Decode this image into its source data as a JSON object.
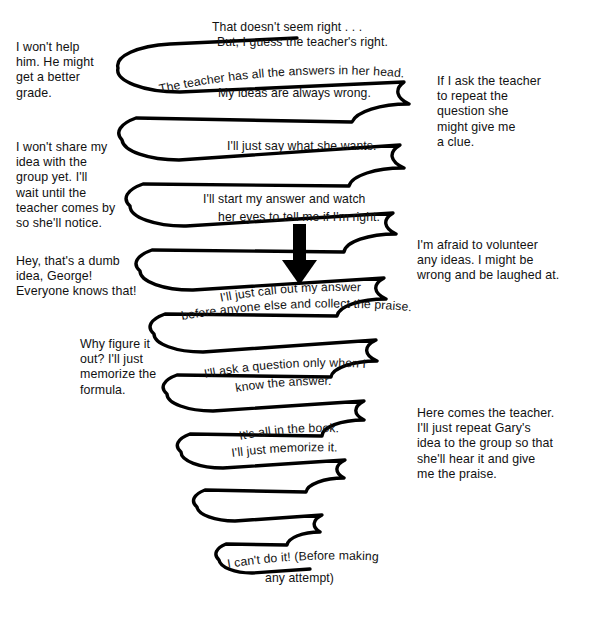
{
  "diagram": {
    "shape": "conical-spiral",
    "stroke_color": "#000000",
    "background_color": "#ffffff",
    "arrow": {
      "name": "downward-arrow",
      "direction": "down",
      "color": "#000000"
    }
  },
  "left_notes": [
    {
      "id": "note-1",
      "text": "I won't help\nhim. He might\nget a better\ngrade."
    },
    {
      "id": "note-2",
      "text": "I won't share my\nidea with the\ngroup yet. I'll\nwait until the\nteacher comes by\nso she'll notice."
    },
    {
      "id": "note-3",
      "text": "Hey, that's a dumb\nidea, George!\nEveryone knows that!"
    },
    {
      "id": "note-4",
      "text": "Why figure it\nout? I'll just\nmemorize the\nformula."
    }
  ],
  "right_notes": [
    {
      "id": "note-5",
      "text": "If I ask the teacher\nto repeat the\nquestion she\nmight give me\na clue."
    },
    {
      "id": "note-6",
      "text": "I'm afraid to volunteer\nany ideas. I might be\nwrong and be laughed at."
    },
    {
      "id": "note-7",
      "text": "Here comes the teacher.\nI'll just repeat Gary's\nidea to the group so that\nshe'll hear it and give\nme the praise."
    }
  ],
  "spiral_labels": [
    {
      "id": "label-1",
      "line1": "That doesn't seem right . . .",
      "line2": "But, I guess the teacher's right."
    },
    {
      "id": "label-2",
      "line1": "The teacher has all  the answers in her head."
    },
    {
      "id": "label-3",
      "line1": "My ideas are always wrong."
    },
    {
      "id": "label-4",
      "line1": "I'll just say what she wants."
    },
    {
      "id": "label-5",
      "line1": "I'll start my answer and watch",
      "line2": "her eyes  to tell me if I'm right."
    },
    {
      "id": "label-6",
      "line1": "I'll just call out my answer",
      "line2": "before  anyone else and collect the praise."
    },
    {
      "id": "label-7",
      "line1": "I'll ask a question only  when I",
      "line2": "know the answer."
    },
    {
      "id": "label-8",
      "line1": "It's all in the book.",
      "line2": "I'll just memorize it."
    },
    {
      "id": "label-9",
      "line1": "I can't do it! (Before making",
      "line2": "any attempt)"
    }
  ]
}
